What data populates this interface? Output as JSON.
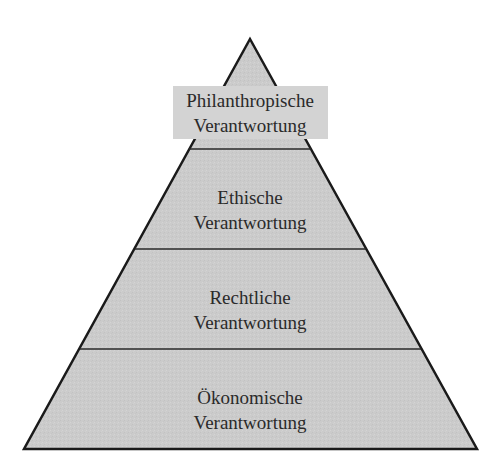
{
  "diagram": {
    "type": "pyramid",
    "colors": {
      "fill": "#cccccc",
      "stroke": "#1a1a1a",
      "label_box": "#d3d3d3",
      "text": "#2a2a2a"
    },
    "tiers": [
      {
        "level": 4,
        "position": "top",
        "line1": "Philanthropische",
        "line2": "Verantwortung"
      },
      {
        "level": 3,
        "position": "upper-middle",
        "line1": "Ethische",
        "line2": "Verantwortung"
      },
      {
        "level": 2,
        "position": "lower-middle",
        "line1": "Rechtliche",
        "line2": "Verantwortung"
      },
      {
        "level": 1,
        "position": "base",
        "line1": "Ökonomische",
        "line2": "Verantwortung"
      }
    ]
  }
}
